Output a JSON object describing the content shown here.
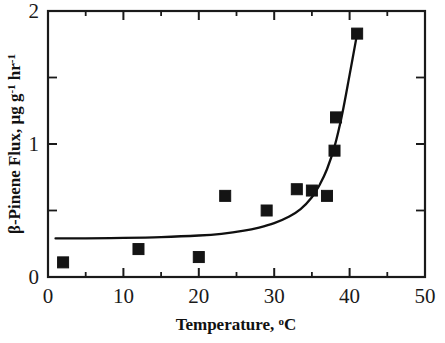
{
  "chart_data": {
    "type": "scatter",
    "title": "",
    "xlabel": "Temperature, °C",
    "ylabel": "β-Pinene Flux, μg g-1 hr-1",
    "xlim": [
      0,
      50
    ],
    "ylim": [
      0,
      2
    ],
    "grid": false,
    "legend": null,
    "x_major_ticks": [
      0,
      10,
      20,
      30,
      40,
      50
    ],
    "x_minor_ticks": [
      5,
      15,
      25,
      35,
      45
    ],
    "y_major_ticks": [
      0,
      1,
      2
    ],
    "y_minor_ticks": [
      0.5,
      1.5
    ],
    "x_tick_labels": [
      "0",
      "10",
      "20",
      "30",
      "40",
      "50"
    ],
    "y_tick_labels": [
      "0",
      "1",
      "2"
    ],
    "marker_style": "filled-square",
    "marker_color": "#141414",
    "series": [
      {
        "name": "β-Pinene flux measurements",
        "points": [
          {
            "x": 2.0,
            "y": 0.11
          },
          {
            "x": 12.0,
            "y": 0.21
          },
          {
            "x": 20.0,
            "y": 0.15
          },
          {
            "x": 23.5,
            "y": 0.61
          },
          {
            "x": 29.0,
            "y": 0.5
          },
          {
            "x": 33.0,
            "y": 0.66
          },
          {
            "x": 35.0,
            "y": 0.65
          },
          {
            "x": 37.0,
            "y": 0.61
          },
          {
            "x": 38.0,
            "y": 0.95
          },
          {
            "x": 38.2,
            "y": 1.2
          },
          {
            "x": 41.0,
            "y": 1.83
          }
        ]
      }
    ],
    "fit_curve": {
      "name": "exponential fit",
      "points": [
        {
          "x": 1.0,
          "y": 0.29
        },
        {
          "x": 5.0,
          "y": 0.291
        },
        {
          "x": 10.0,
          "y": 0.294
        },
        {
          "x": 15.0,
          "y": 0.3
        },
        {
          "x": 20.0,
          "y": 0.312
        },
        {
          "x": 23.0,
          "y": 0.325
        },
        {
          "x": 26.0,
          "y": 0.348
        },
        {
          "x": 28.0,
          "y": 0.372
        },
        {
          "x": 30.0,
          "y": 0.405
        },
        {
          "x": 32.0,
          "y": 0.455
        },
        {
          "x": 33.5,
          "y": 0.51
        },
        {
          "x": 35.0,
          "y": 0.6
        },
        {
          "x": 36.0,
          "y": 0.69
        },
        {
          "x": 37.0,
          "y": 0.81
        },
        {
          "x": 38.0,
          "y": 0.98
        },
        {
          "x": 39.0,
          "y": 1.22
        },
        {
          "x": 40.0,
          "y": 1.52
        },
        {
          "x": 41.0,
          "y": 1.83
        }
      ]
    }
  },
  "axis_labels": {
    "x_title_main": "Temperature, ",
    "x_title_sup": "o",
    "x_title_tail": "C",
    "y_title_part1": "-Pinene Flux, ",
    "y_title_beta": "β",
    "y_title_mu": "μ",
    "y_title_g1": "g g",
    "y_title_sup1": "-1",
    "y_title_hr": " hr",
    "y_title_sup2": "-1"
  },
  "colors": {
    "axis": "#1a1a1a",
    "marker": "#141414",
    "curve": "#101010",
    "background": "#ffffff"
  }
}
